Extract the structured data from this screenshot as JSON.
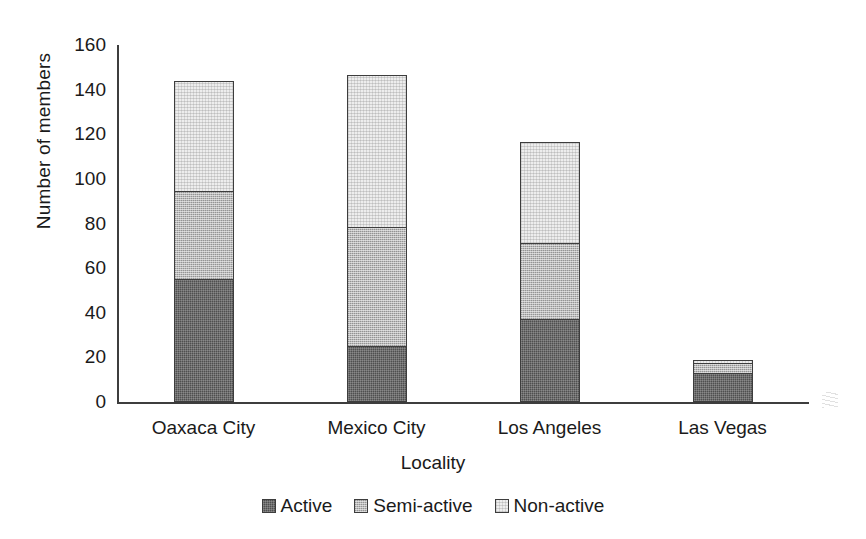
{
  "chart_data": {
    "type": "bar",
    "stacked": true,
    "title": "",
    "xlabel": "Locality",
    "ylabel": "Number of members",
    "categories": [
      "Oaxaca City",
      "Mexico City",
      "Los Angeles",
      "Las Vegas"
    ],
    "series": [
      {
        "name": "Active",
        "values": [
          55,
          25,
          37,
          13
        ],
        "color": "#4f4f4f"
      },
      {
        "name": "Semi-active",
        "values": [
          40,
          54,
          35,
          5
        ],
        "color": "#b9b9b9"
      },
      {
        "name": "Non-active",
        "values": [
          50,
          69,
          46,
          2
        ],
        "color": "#ededed"
      }
    ],
    "totals": [
      145,
      148,
      118,
      20
    ],
    "ylim": [
      0,
      160
    ],
    "yticks": [
      0,
      20,
      40,
      60,
      80,
      100,
      120,
      140,
      160
    ],
    "ytick_labels": [
      "0",
      "20",
      "40",
      "60",
      "80",
      "100",
      "120",
      "140",
      "160"
    ],
    "grid": false,
    "legend_position": "bottom"
  },
  "legend": {
    "items": [
      {
        "label": "Active"
      },
      {
        "label": "Semi-active"
      },
      {
        "label": "Non-active"
      }
    ]
  }
}
